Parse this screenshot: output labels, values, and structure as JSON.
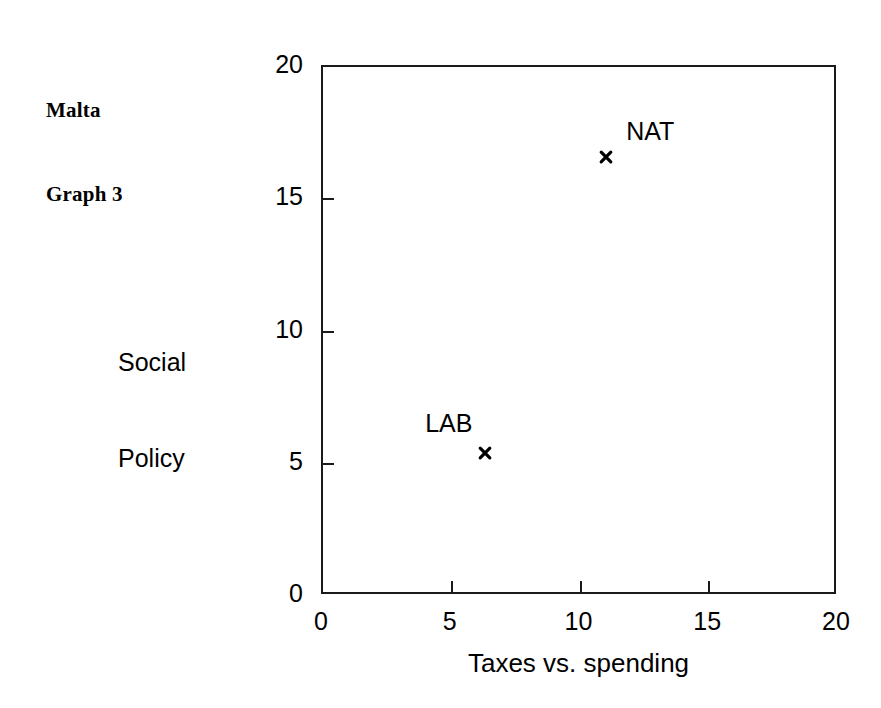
{
  "figure": {
    "title_lines": [
      "Malta",
      "Graph 3"
    ],
    "background_color": "#ffffff",
    "axis_color": "#1a1a1a",
    "text_color": "#000000"
  },
  "chart_data": {
    "type": "scatter",
    "title": "Malta Graph 3",
    "xlabel": "Taxes vs. spending",
    "ylabel": "Social Policy",
    "xlim": [
      0,
      20
    ],
    "ylim": [
      0,
      20
    ],
    "xticks": [
      0,
      5,
      10,
      15,
      20
    ],
    "yticks": [
      0,
      5,
      10,
      15,
      20
    ],
    "xtick_labels": [
      "0",
      "5",
      "10",
      "15",
      "20"
    ],
    "ytick_labels": [
      "0",
      "5",
      "10",
      "15",
      "20"
    ],
    "grid": false,
    "legend": "none",
    "marker": "x",
    "marker_color": "#000000",
    "points": [
      {
        "label": "NAT",
        "x": 11.0,
        "y": 16.6,
        "label_position": "above-right"
      },
      {
        "label": "LAB",
        "x": 6.3,
        "y": 5.4,
        "label_position": "above-left"
      }
    ]
  },
  "axis_titles": {
    "y_lines": [
      "Social",
      "Policy"
    ],
    "x": "Taxes vs. spending"
  }
}
